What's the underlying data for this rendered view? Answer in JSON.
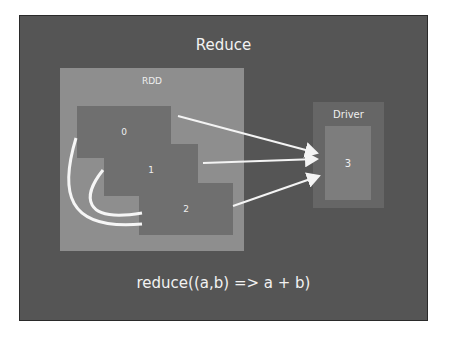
{
  "slide": {
    "title": "Reduce",
    "rdd": {
      "label": "RDD",
      "partitions": [
        {
          "label": "0"
        },
        {
          "label": "1"
        },
        {
          "label": "2"
        }
      ]
    },
    "driver": {
      "label": "Driver",
      "result": "3"
    },
    "code": "reduce((a,b) => a + b)"
  },
  "colors": {
    "slide_bg": "#555555",
    "rdd_bg": "#8e8e8e",
    "partition_bg": "#6f6f6f",
    "driver_bg": "#666666",
    "result_bg": "#7d7d7d",
    "text": "#f2f2f2"
  }
}
